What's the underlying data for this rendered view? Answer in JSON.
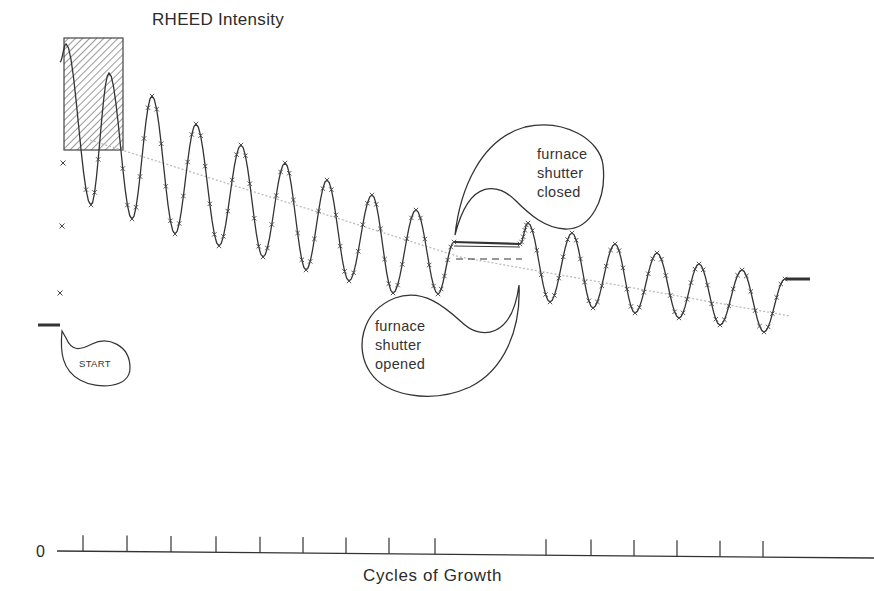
{
  "chart_data": {
    "type": "line",
    "title": "RHEED Intensity",
    "xlabel": "Cycles of Growth",
    "ylabel": "RHEED Intensity",
    "y_origin_label": "0",
    "grid": false,
    "legend": null,
    "x_ticks_px": [
      83,
      127,
      171,
      216,
      260,
      303,
      346,
      389,
      435,
      546,
      591,
      634,
      677,
      720,
      763
    ],
    "series": [
      {
        "name": "RHEED intensity (measured, x markers)",
        "style": "markers+line",
        "segments": [
          {
            "phase": "before start",
            "points": [
              [
                38,
                325
              ],
              [
                60,
                325
              ]
            ]
          },
          {
            "phase": "growth 1 (shutter open)",
            "peaks": [
              [
                66,
                44
              ],
              [
                109,
                73
              ],
              [
                152,
                96
              ],
              [
                196,
                124
              ],
              [
                241,
                145
              ],
              [
                285,
                163
              ],
              [
                327,
                180
              ],
              [
                372,
                195
              ],
              [
                416,
                210
              ]
            ],
            "troughs": [
              [
                91,
                205
              ],
              [
                132,
                219
              ],
              [
                175,
                234
              ],
              [
                219,
                246
              ],
              [
                263,
                257
              ],
              [
                306,
                270
              ],
              [
                349,
                281
              ],
              [
                393,
                293
              ],
              [
                438,
                294
              ]
            ]
          },
          {
            "phase": "shutter closed (recovery)",
            "points": [
              [
                454,
                242
              ],
              [
                520,
                244
              ]
            ]
          },
          {
            "phase": "growth 2 (shutter open)",
            "peaks": [
              [
                528,
                223
              ],
              [
                572,
                233
              ],
              [
                615,
                244
              ],
              [
                657,
                253
              ],
              [
                699,
                264
              ],
              [
                742,
                270
              ]
            ],
            "troughs": [
              [
                550,
                302
              ],
              [
                593,
                308
              ],
              [
                635,
                313
              ],
              [
                679,
                318
              ],
              [
                720,
                325
              ],
              [
                764,
                332
              ]
            ]
          },
          {
            "phase": "after growth",
            "points": [
              [
                785,
                279
              ],
              [
                810,
                279
              ]
            ]
          }
        ],
        "isolated_markers": [
          [
            63,
            163
          ],
          [
            62,
            226
          ],
          [
            60,
            293
          ]
        ]
      },
      {
        "name": "Mean intensity trend",
        "style": "dotted-gray",
        "points": [
          [
            90,
            140
          ],
          [
            460,
            257
          ],
          [
            790,
            316
          ]
        ]
      },
      {
        "name": "Extrapolated level",
        "style": "dashed",
        "points": [
          [
            456,
            259
          ],
          [
            522,
            259
          ]
        ]
      }
    ],
    "annotations": [
      {
        "text": "START",
        "shape": "callout"
      },
      {
        "text": "furnace shutter opened",
        "shape": "callout"
      },
      {
        "text": "furnace shutter closed",
        "shape": "callout"
      },
      {
        "text": "initial transient",
        "shape": "hatched-rectangle",
        "bbox": [
          64,
          38,
          123,
          150
        ]
      }
    ]
  },
  "labels": {
    "title": "RHEED Intensity",
    "xlabel": "Cycles of Growth",
    "zero": "0",
    "start": "START",
    "opened": [
      "furnace",
      "shutter",
      "opened"
    ],
    "closed": [
      "furnace",
      "shutter",
      "closed"
    ]
  },
  "colors": {
    "ink": "#333333",
    "trend": "#bbbbbb",
    "hatch": "#555555"
  }
}
